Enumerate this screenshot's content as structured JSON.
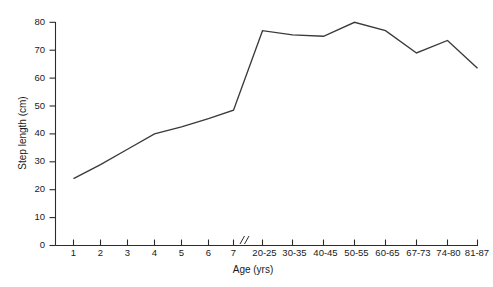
{
  "chart_data": {
    "type": "line",
    "title": "",
    "xlabel": "Age (yrs)",
    "ylabel": "Step length (cm)",
    "categories": [
      "1",
      "2",
      "3",
      "4",
      "5",
      "6",
      "7",
      "20-25",
      "30-35",
      "40-45",
      "50-55",
      "60-65",
      "67-73",
      "74-80",
      "81-87"
    ],
    "values": [
      24,
      29,
      34.5,
      40,
      42.5,
      45.5,
      48.5,
      77,
      75.5,
      75,
      80,
      77,
      69,
      73.5,
      63.5
    ],
    "series": [
      {
        "name": "Step length",
        "values": [
          24,
          29,
          34.5,
          40,
          42.5,
          45.5,
          48.5,
          77,
          75.5,
          75,
          80,
          77,
          69,
          73.5,
          63.5
        ]
      }
    ],
    "ylim": [
      0,
      80
    ],
    "yticks": [
      0,
      10,
      20,
      30,
      40,
      50,
      60,
      70,
      80
    ],
    "ytick_labels": [
      "0",
      "10",
      "20",
      "30",
      "40",
      "50",
      "60",
      "70",
      "80"
    ],
    "grid": false,
    "legend": "none",
    "axis_break": {
      "present": true,
      "between": [
        "7",
        "20-25"
      ],
      "glyph": "//"
    },
    "line_color": "#3a3a3a",
    "axis_color": "#2b2b2b"
  },
  "axes": {
    "y_title": "Step length (cm)",
    "x_title": "Age (yrs)"
  }
}
